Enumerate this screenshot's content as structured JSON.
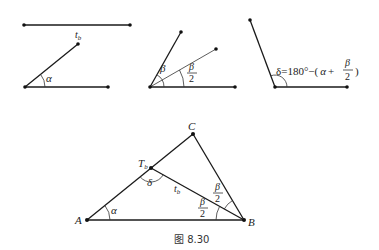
{
  "figure": {
    "caption": "图 8.30",
    "colors": {
      "line": "#1a1a1a",
      "background": "#ffffff"
    }
  },
  "panel_segment": {
    "label": "t",
    "label_sub": "b"
  },
  "panel_alpha": {
    "angle_label": "α"
  },
  "panel_beta": {
    "angle_label": "β",
    "half_num": "β",
    "half_den": "2"
  },
  "panel_delta": {
    "formula_prefix": "δ=180°−(",
    "formula_alpha": "α",
    "formula_plus": "+",
    "formula_num": "β",
    "formula_den": "2",
    "formula_close": ")"
  },
  "triangle": {
    "vertex_a": "A",
    "vertex_b": "B",
    "vertex_c": "C",
    "point_t": "T",
    "point_t_sub": "b",
    "segment_label": "t",
    "segment_label_sub": "b",
    "angle_alpha": "α",
    "angle_delta": "δ",
    "half_beta_num": "β",
    "half_beta_den": "2"
  }
}
